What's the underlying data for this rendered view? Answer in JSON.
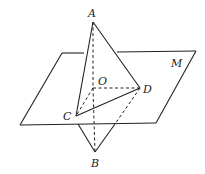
{
  "figure": {
    "plane": {
      "label": "M"
    },
    "points": {
      "A": {
        "label": "A"
      },
      "B": {
        "label": "B"
      },
      "C": {
        "label": "C"
      },
      "D": {
        "label": "D"
      },
      "O": {
        "label": "O"
      }
    },
    "segments": [
      {
        "from": "A",
        "to": "C",
        "style": "solid"
      },
      {
        "from": "A",
        "to": "D",
        "style": "solid"
      },
      {
        "from": "C",
        "to": "D",
        "style": "solid"
      },
      {
        "from": "C",
        "to": "B",
        "style": "solid"
      },
      {
        "from": "D",
        "to": "B",
        "style": "dashed-then-solid"
      },
      {
        "from": "A",
        "to": "B",
        "via": "O",
        "style": "dashed"
      },
      {
        "from": "O",
        "to": "C",
        "style": "dashed"
      },
      {
        "from": "O",
        "to": "D",
        "style": "dashed"
      }
    ],
    "colors": {
      "line": "#222222",
      "background": "#ffffff"
    }
  }
}
